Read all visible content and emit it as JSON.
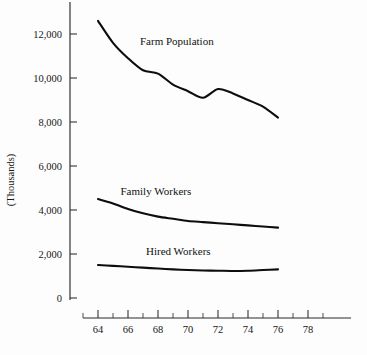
{
  "chart_data": {
    "type": "line",
    "title": "",
    "xlabel": "",
    "ylabel": "(Thousands)",
    "xlim": [
      62.8,
      79.2
    ],
    "ylim": [
      0,
      13000
    ],
    "grid": false,
    "legend": "inline-labels",
    "y_ticks": [
      {
        "value": 0,
        "label": "0"
      },
      {
        "value": 2000,
        "label": "2,000"
      },
      {
        "value": 4000,
        "label": "4,000"
      },
      {
        "value": 6000,
        "label": "6,000"
      },
      {
        "value": 8000,
        "label": "8,000"
      },
      {
        "value": 10000,
        "label": "10,000"
      },
      {
        "value": 12000,
        "label": "12,000"
      }
    ],
    "x_ticks_major": [
      {
        "value": 64,
        "label": "64"
      },
      {
        "value": 66,
        "label": "66"
      },
      {
        "value": 68,
        "label": "68"
      },
      {
        "value": 70,
        "label": "70"
      },
      {
        "value": 72,
        "label": "72"
      },
      {
        "value": 74,
        "label": "74"
      },
      {
        "value": 76,
        "label": "76"
      },
      {
        "value": 78,
        "label": "78"
      }
    ],
    "x_ticks_minor": [
      63,
      65,
      67,
      69,
      71,
      73,
      75,
      77,
      79
    ],
    "x": [
      64,
      65,
      66,
      67,
      68,
      69,
      70,
      71,
      72,
      73,
      74,
      75,
      76
    ],
    "series": [
      {
        "name": "Farm Population",
        "label": "Farm Population",
        "label_x": 66.8,
        "label_y": 11500,
        "color": "#0d0d0d",
        "values": [
          12600,
          11600,
          10900,
          10350,
          10200,
          9700,
          9400,
          9100,
          9500,
          9300,
          9000,
          8700,
          8200
        ]
      },
      {
        "name": "Family Workers",
        "label": "Family Workers",
        "label_x": 65.5,
        "label_y": 4700,
        "color": "#0d0d0d",
        "values": [
          4500,
          4300,
          4050,
          3850,
          3700,
          3600,
          3500,
          3450,
          3400,
          3350,
          3300,
          3250,
          3200
        ]
      },
      {
        "name": "Hired Workers",
        "label": "Hired Workers",
        "label_x": 67.2,
        "label_y": 1950,
        "color": "#0d0d0d",
        "values": [
          1500,
          1460,
          1420,
          1380,
          1340,
          1300,
          1270,
          1250,
          1240,
          1230,
          1240,
          1270,
          1300
        ]
      }
    ]
  }
}
